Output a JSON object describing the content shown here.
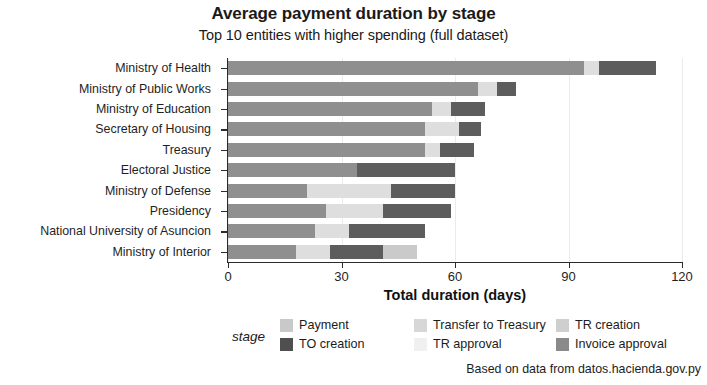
{
  "chart_data": {
    "type": "bar",
    "orientation": "horizontal",
    "stacked": true,
    "title": "Average payment duration by stage",
    "subtitle": "Top 10 entities with higher spending (full dataset)",
    "xlabel": "Total duration (days)",
    "ylabel": "",
    "xlim": [
      0,
      120
    ],
    "xticks": [
      0,
      30,
      60,
      90,
      120
    ],
    "xtick_labels": [
      "0",
      "30",
      "60",
      "90",
      "120"
    ],
    "grid": true,
    "legend_title": "stage",
    "legend_position": "bottom",
    "caption": "Based on data from datos.hacienda.gov.py",
    "categories": [
      "Ministry of Health",
      "Ministry of Public Works",
      "Ministry of Education",
      "Secretary of Housing",
      "Treasury",
      "Electoral Justice",
      "Ministry of Defense",
      "Presidency",
      "National University of Asuncion",
      "Ministry of Interior"
    ],
    "series": [
      {
        "name": "Payment",
        "color": "#c9c9c9",
        "values": [
          0.0,
          0.0,
          0.0,
          0.0,
          0.0,
          0.0,
          0.0,
          0.0,
          0.0,
          0.0
        ]
      },
      {
        "name": "TO creation",
        "color": "#4f4f4f",
        "values": [
          0.0,
          0.0,
          0.0,
          0.0,
          0.0,
          0.0,
          0.0,
          0.0,
          0.0,
          0.0
        ]
      },
      {
        "name": "Transfer to Treasury",
        "color": "#d7d7d7",
        "values": [
          0.0,
          0.0,
          0.0,
          0.0,
          0.0,
          0.0,
          0.0,
          0.0,
          0.0,
          0.0
        ]
      },
      {
        "name": "TR approval",
        "color": "#efefef",
        "values": [
          0.0,
          0.0,
          0.0,
          0.0,
          0.0,
          0.0,
          0.0,
          0.0,
          0.0,
          0.0
        ]
      },
      {
        "name": "TR creation",
        "color": "#cfcfcf",
        "values": [
          94.0,
          66.0,
          54.0,
          52.0,
          52.0,
          52.0,
          21.0,
          26.0,
          23.0,
          18.0
        ]
      },
      {
        "name": "Invoice approval",
        "color": "#6e6e6e",
        "values": [
          0.0,
          0.0,
          0.0,
          0.0,
          0.0,
          0.0,
          0.0,
          0.0,
          0.0,
          0.0
        ]
      }
    ],
    "bars": [
      {
        "category": "Ministry of Health",
        "total": 113.0,
        "segments": [
          {
            "stage": "TR creation",
            "value": 94.0,
            "color": "#8f8f8f"
          },
          {
            "stage": "TR approval",
            "value": 4.0,
            "color": "#dedede"
          },
          {
            "stage": "Invoice approval",
            "value": 15.0,
            "color": "#5d5d5d"
          }
        ]
      },
      {
        "category": "Ministry of Public Works",
        "total": 76.0,
        "segments": [
          {
            "stage": "TR creation",
            "value": 66.0,
            "color": "#8f8f8f"
          },
          {
            "stage": "TR approval",
            "value": 5.0,
            "color": "#dedede"
          },
          {
            "stage": "Invoice approval",
            "value": 5.0,
            "color": "#5d5d5d"
          }
        ]
      },
      {
        "category": "Ministry of Education",
        "total": 68.0,
        "segments": [
          {
            "stage": "TR creation",
            "value": 54.0,
            "color": "#8f8f8f"
          },
          {
            "stage": "TR approval",
            "value": 5.0,
            "color": "#dedede"
          },
          {
            "stage": "Invoice approval",
            "value": 9.0,
            "color": "#5d5d5d"
          }
        ]
      },
      {
        "category": "Secretary of Housing",
        "total": 67.0,
        "segments": [
          {
            "stage": "TR creation",
            "value": 52.0,
            "color": "#8f8f8f"
          },
          {
            "stage": "TR approval",
            "value": 9.0,
            "color": "#dedede"
          },
          {
            "stage": "Invoice approval",
            "value": 6.0,
            "color": "#5d5d5d"
          }
        ]
      },
      {
        "category": "Treasury",
        "total": 65.0,
        "segments": [
          {
            "stage": "TR creation",
            "value": 52.0,
            "color": "#8f8f8f"
          },
          {
            "stage": "TR approval",
            "value": 4.0,
            "color": "#dedede"
          },
          {
            "stage": "Invoice approval",
            "value": 9.0,
            "color": "#5d5d5d"
          }
        ]
      },
      {
        "category": "Electoral Justice",
        "total": 60.0,
        "segments": [
          {
            "stage": "TR creation",
            "value": 34.0,
            "color": "#8f8f8f"
          },
          {
            "stage": "Invoice approval",
            "value": 26.0,
            "color": "#5d5d5d"
          }
        ]
      },
      {
        "category": "Ministry of Defense",
        "total": 60.0,
        "segments": [
          {
            "stage": "TR creation",
            "value": 21.0,
            "color": "#8f8f8f"
          },
          {
            "stage": "TR approval",
            "value": 22.0,
            "color": "#dedede"
          },
          {
            "stage": "Invoice approval",
            "value": 17.0,
            "color": "#5d5d5d"
          }
        ]
      },
      {
        "category": "Presidency",
        "total": 59.0,
        "segments": [
          {
            "stage": "TR creation",
            "value": 26.0,
            "color": "#8f8f8f"
          },
          {
            "stage": "TR approval",
            "value": 15.0,
            "color": "#dedede"
          },
          {
            "stage": "Invoice approval",
            "value": 18.0,
            "color": "#5d5d5d"
          }
        ]
      },
      {
        "category": "National University of Asuncion",
        "total": 52.0,
        "segments": [
          {
            "stage": "TR creation",
            "value": 23.0,
            "color": "#8f8f8f"
          },
          {
            "stage": "TR approval",
            "value": 9.0,
            "color": "#dedede"
          },
          {
            "stage": "Invoice approval",
            "value": 20.0,
            "color": "#5d5d5d"
          }
        ]
      },
      {
        "category": "Ministry of Interior",
        "total": 50.0,
        "segments": [
          {
            "stage": "TR creation",
            "value": 18.0,
            "color": "#8f8f8f"
          },
          {
            "stage": "TR approval",
            "value": 9.0,
            "color": "#dedede"
          },
          {
            "stage": "Invoice approval",
            "value": 14.0,
            "color": "#5d5d5d"
          },
          {
            "stage": "TR creation",
            "value": 9.0,
            "color": "#cacaca"
          }
        ]
      }
    ],
    "legend_columns": [
      {
        "items": [
          {
            "label": "Payment",
            "color": "#c9c9c9"
          },
          {
            "label": "TO creation",
            "color": "#4f4f4f"
          }
        ]
      },
      {
        "items": [
          {
            "label": "Transfer to Treasury",
            "color": "#d7d7d7"
          },
          {
            "label": "TR approval",
            "color": "#f0f0f0"
          }
        ]
      },
      {
        "items": [
          {
            "label": "TR creation",
            "color": "#cfcfcf"
          },
          {
            "label": "Invoice approval",
            "color": "#8a8a8a"
          }
        ]
      }
    ]
  }
}
